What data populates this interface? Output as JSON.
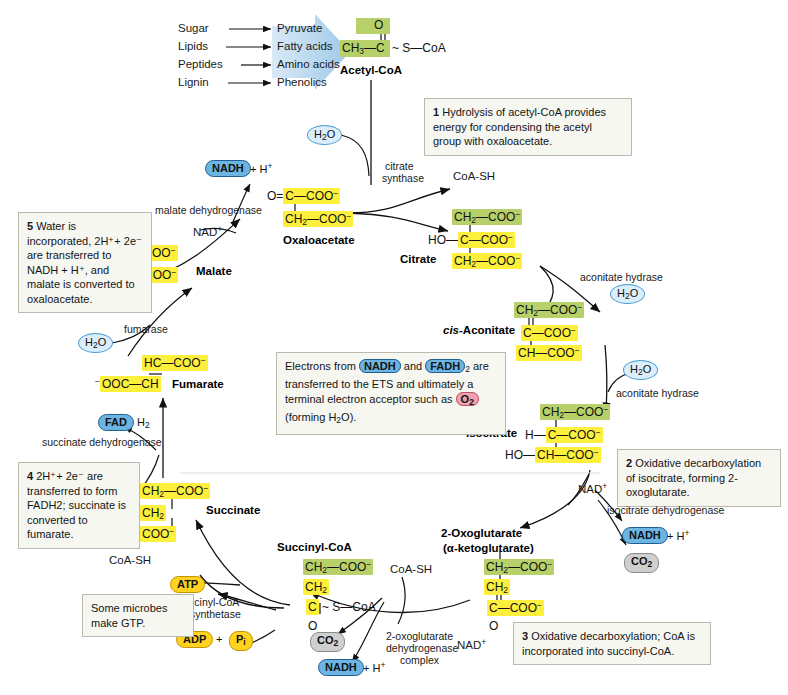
{
  "figure": {
    "title_fragment": "",
    "type": "citric-acid-cycle-diagram"
  },
  "inputs": {
    "rows": [
      {
        "source": "Sugar",
        "product": "Pyruvate"
      },
      {
        "source": "Lipids",
        "product": "Fatty acids"
      },
      {
        "source": "Peptides",
        "product": "Amino acids"
      },
      {
        "source": "Lignin",
        "product": "Phenolics"
      }
    ]
  },
  "molecules": {
    "acetyl_coa": {
      "name": "Acetyl-CoA",
      "top": "O",
      "line1": "CH3—C ~ S—CoA"
    },
    "oxaloacetate": {
      "name": "Oxaloacetate",
      "row1": "O=C—COO⁻",
      "row2": "CH2—COO⁻"
    },
    "citrate": {
      "name": "Citrate",
      "row1": "CH2—COO⁻",
      "row2": "HO—C—COO⁻",
      "row3": "CH2—COO⁻"
    },
    "cis_aconitate": {
      "name_italic": "cis-",
      "name": "Aconitate",
      "row1": "CH2—COO⁻",
      "row2": "C—COO⁻",
      "row3": "CH—COO⁻"
    },
    "isocitrate": {
      "name": "Isocitrate",
      "row1": "CH2—COO⁻",
      "row2": "H—C—COO⁻",
      "row3": "HO—CH—COO⁻"
    },
    "oxoglutarate": {
      "name": "2-Oxoglutarate",
      "name2": "(α-ketoglutarate)",
      "row1": "CH2—COO⁻",
      "row2": "CH2",
      "row3": "C—COO⁻",
      "row4": "O"
    },
    "succinyl_coa": {
      "name": "Succinyl-CoA",
      "row1": "CH2—COO⁻",
      "row2": "CH2",
      "row3": "C ~ S—CoA",
      "row4": "O"
    },
    "succinate": {
      "name": "Succinate",
      "row1": "CH2—COO⁻",
      "row2": "CH2",
      "row3": "COO⁻"
    },
    "fumarate": {
      "name": "Fumarate",
      "row1": "HC—COO⁻",
      "row2": "⁻OOC—CH"
    },
    "malate": {
      "name": "Malate",
      "row1": "HO—CH—COO⁻",
      "row2": "CH2—COO⁻"
    }
  },
  "enzymes": {
    "citrate_synthase_l1": "citrate",
    "citrate_synthase_l2": "synthase",
    "aconitate_hydrase_1": "aconitate hydrase",
    "aconitate_hydrase_2": "aconitate hydrase",
    "isocitrate_dehydrogenase": "isocitrate dehydrogenase",
    "oxoglutarate_dh_l1": "2-oxoglutarate",
    "oxoglutarate_dh_l2": "dehydrogenase",
    "oxoglutarate_dh_l3": "complex",
    "succinyl_coa_synthetase_l1": "succinyl-CoA",
    "succinyl_coa_synthetase_l2": "synthetase",
    "succinate_dehydrogenase": "succinate dehydrogenase",
    "fumarase": "fumarase",
    "malate_dehydrogenase": "malate dehydrogenase"
  },
  "cofactors": {
    "h2o_1": "H2O",
    "h2o_2": "H2O",
    "h2o_3": "H2O",
    "h2o_4": "H2O",
    "coa_sh_top": "CoA-SH",
    "coa_sh_mid": "CoA-SH",
    "coa_sh_left": "CoA-SH",
    "nadh_1": "NADH",
    "nadh_1_suffix": "+ H⁺",
    "nadh_2": "NADH",
    "nadh_2_suffix": "+ H⁺",
    "nadh_3": "NADH",
    "nadh_3_suffix": "+ H⁺",
    "nad_plus_1": "NAD⁺",
    "nad_plus_2": "NAD⁺",
    "nad_plus_3": "NAD⁺",
    "co2_1": "CO2",
    "co2_2": "CO2",
    "fad": "FAD",
    "fadh2": "FAD",
    "fadh2_suffix": "H2",
    "atp": "ATP",
    "adp": "ADP",
    "pi": "Pi",
    "plus_sign": "+"
  },
  "callouts": {
    "step1": {
      "number": "1",
      "text": "Hydrolysis of acetyl-CoA provides energy for condensing the acetyl group with oxaloacetate."
    },
    "step2": {
      "number": "2",
      "text": "Oxidative decarboxylation of isocitrate, forming 2-oxoglutarate."
    },
    "step3": {
      "number": "3",
      "text": "Oxidative decarboxylation; CoA is incorporated into succinyl-CoA."
    },
    "step4": {
      "number": "4",
      "text": "2H⁺+ 2e⁻ are transferred to form FADH2; succinate is converted to fumarate."
    },
    "step5": {
      "number": "5",
      "text": "Water is incorporated, 2H⁺+ 2e⁻ are transferred to NADH + H⁺, and malate is converted to oxaloacetate."
    },
    "gtp": {
      "text": "Some microbes make GTP."
    },
    "ets": {
      "part1": "Electrons from ",
      "nadh": "NADH",
      "part2": " and ",
      "fadh": "FADH",
      "fadh_sub": "2",
      "part3": "are transferred to the ETS and ultimately a terminal electron acceptor such as ",
      "o2": "O2",
      "part4": "(forming H2O)."
    }
  },
  "colors": {
    "highlight_yellow": "#fdf03c",
    "highlight_green": "#b8d06a",
    "pill_blue": "#6cb5e2",
    "pill_yellow": "#ffd21e",
    "pill_grey": "#cfcfcf",
    "pill_red": "#f0a0ae",
    "bubble_blue_fill": "#ddeefb",
    "callout_bg": "#f6f7f1",
    "arrow_wedge": "#bcd9ee"
  }
}
